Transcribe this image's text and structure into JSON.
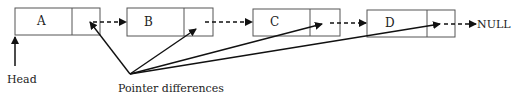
{
  "diagram": {
    "type": "linked-list",
    "nodes": [
      {
        "label": "A"
      },
      {
        "label": "B"
      },
      {
        "label": "C"
      },
      {
        "label": "D"
      }
    ],
    "terminal": "NULL",
    "head_label": "Head",
    "annotation": "Pointer differences",
    "colors": {
      "stroke": "#222222",
      "box": "#555555",
      "background": "#ffffff"
    }
  }
}
